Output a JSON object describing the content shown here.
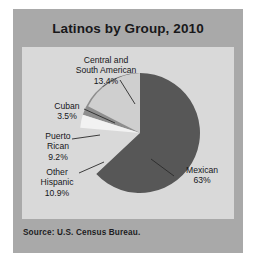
{
  "figure": {
    "title": "Latinos by Group, 2010",
    "source": "Source: U.S. Census Bureau.",
    "frame_color": "#a9a9a9",
    "panel_color": "#d9d9d9"
  },
  "chart_data": {
    "type": "pie",
    "title": "Latinos by Group, 2010",
    "xlabel": "",
    "ylabel": "",
    "legend_position": "none",
    "grid": false,
    "start_angle_deg": 0,
    "direction": "clockwise",
    "categories": [
      "Mexican",
      "Central and South American",
      "Cuban",
      "Puerto Rican",
      "Other Hispanic"
    ],
    "values": [
      63.0,
      13.4,
      3.5,
      9.2,
      10.9
    ],
    "value_labels": [
      "63%",
      "13.4%",
      "3.5%",
      "9.2%",
      "10.9%"
    ],
    "colors": [
      "#575757",
      "#cfcfcf",
      "#f2f2f2",
      "#8e8e8e",
      "#5c5c5c"
    ],
    "annotations": [
      "Source: U.S. Census Bureau."
    ]
  },
  "labels": {
    "mexican": {
      "name": "Mexican",
      "value": "63%"
    },
    "central": {
      "name": "Central and South American",
      "name_line1": "Central and",
      "name_line2": "South American",
      "value": "13.4%"
    },
    "cuban": {
      "name": "Cuban",
      "value": "3.5%"
    },
    "puerto": {
      "name": "Puerto Rican",
      "name_line1": "Puerto",
      "name_line2": "Rican",
      "value": "9.2%"
    },
    "other": {
      "name": "Other Hispanic",
      "name_line1": "Other",
      "name_line2": "Hispanic",
      "value": "10.9%"
    }
  }
}
